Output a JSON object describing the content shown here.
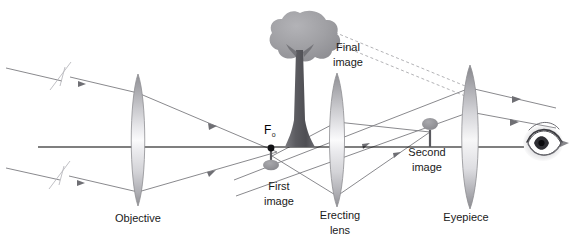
{
  "figure": {
    "type": "optical-ray-diagram",
    "title_visible": false,
    "background_color": "#ffffff",
    "width": 570,
    "height": 243
  },
  "labels": {
    "objective": "Objective",
    "erecting_lens_line1": "Erecting",
    "erecting_lens_line2": "lens",
    "eyepiece": "Eyepiece",
    "first_image_line1": "First",
    "first_image_line2": "image",
    "second_image_line1": "Second",
    "second_image_line2": "image",
    "final_image_line1": "Final",
    "final_image_line2": "image",
    "focal_point": "F",
    "focal_point_subscript": "o"
  },
  "colors": {
    "axis": "#000000",
    "ray": "#7c7c80",
    "virtual_ray_dashed": "#a9a9ad",
    "lens_edge": "#8e8e92",
    "lens_fill_dark": "#9a9a9e",
    "lens_fill_light": "#fdfdfd",
    "tree_canopy": "#9d9da1",
    "tree_trunk": "#58585c",
    "text": "#1a1a1a",
    "eye_dark": "#3a3a3e",
    "background": "#ffffff"
  },
  "elements": {
    "lenses": [
      {
        "name": "objective",
        "cx": 138,
        "cy": 140,
        "half_height": 66,
        "half_width": 9
      },
      {
        "name": "erecting-lens",
        "cx": 337,
        "cy": 140,
        "half_height": 67,
        "half_width": 10
      },
      {
        "name": "eyepiece",
        "cx": 470,
        "cy": 137,
        "half_height": 72,
        "half_width": 10
      }
    ],
    "optical_axis": {
      "x1": 38,
      "y1": 147,
      "x2": 524,
      "y2": 147
    },
    "focal_point_marker": {
      "cx": 271,
      "cy": 148,
      "r": 3.4
    },
    "trees": [
      {
        "name": "final-image",
        "kind": "upright-large",
        "base_x": 300,
        "base_y": 147,
        "height": 128
      },
      {
        "name": "first-image",
        "kind": "inverted-small",
        "base_x": 271,
        "base_y": 147,
        "height": 23
      },
      {
        "name": "second-image",
        "kind": "upright-small",
        "base_x": 430,
        "base_y": 147,
        "height": 27
      }
    ],
    "eye": {
      "name": "observer-eye",
      "cx": 543,
      "cy": 143
    }
  },
  "annotations": {
    "incoming_ray_break_marks": 2,
    "ray_direction_arrows": 6,
    "dashed_virtual_rays": 2
  }
}
